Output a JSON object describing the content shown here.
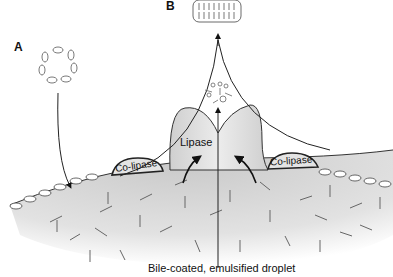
{
  "figure": {
    "panel_labels": {
      "a": "A",
      "b": "B"
    },
    "structures": {
      "lipase": "Lipase",
      "colipase_left": "Co-lipase",
      "colipase_right": "Co-lipase"
    },
    "caption": "Bile-coated, emulsified droplet",
    "elements": [
      "micelle (A)",
      "bilayer vesicle (B)",
      "lipase enzyme",
      "co-lipase (two)",
      "emulsified lipid droplet with bile-salt coat",
      "released fatty acids / monoglycerides",
      "arrows indicating flow"
    ],
    "colors": {
      "droplet_fill": "#d8d8d8",
      "lipase_fill": "#dcdcdc",
      "line": "#222222",
      "background": "#ffffff"
    }
  }
}
